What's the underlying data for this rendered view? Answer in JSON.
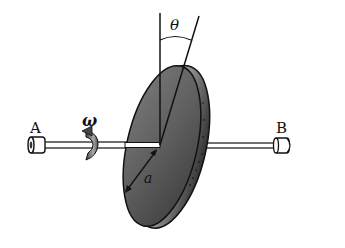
{
  "diagram": {
    "type": "physics-mechanics",
    "labels": {
      "point_a": "A",
      "point_b": "B",
      "angular_velocity": "ω",
      "tilt_angle": "θ",
      "radius": "a"
    },
    "colors": {
      "disk_face": "#5a5a5a",
      "disk_rim": "#3a3a3a",
      "line": "#111111",
      "background": "#ffffff"
    }
  }
}
